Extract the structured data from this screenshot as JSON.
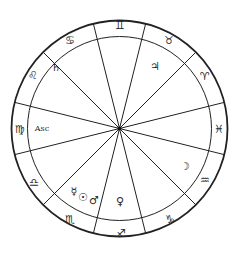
{
  "chart_data": {
    "type": "diagram",
    "title": "",
    "kind": "astrological-natal-chart",
    "geometry": {
      "center": [
        119.5,
        128.5
      ],
      "outer_radius": 108,
      "inner_radius": 92,
      "line_color": "#222222"
    },
    "house_cusp_angles_deg": [
      14,
      45,
      76,
      104,
      135,
      166,
      194,
      225,
      256,
      284,
      315,
      346
    ],
    "signs": [
      {
        "name": "Gemini",
        "glyph": "♊",
        "x": 120,
        "y": 25
      },
      {
        "name": "Cancer",
        "glyph": "♋",
        "x": 70,
        "y": 40
      },
      {
        "name": "Leo",
        "glyph": "♌",
        "x": 33,
        "y": 75
      },
      {
        "name": "Virgo",
        "glyph": "♍",
        "x": 20,
        "y": 129
      },
      {
        "name": "Libra",
        "glyph": "♎",
        "x": 34,
        "y": 182
      },
      {
        "name": "Scorpio",
        "glyph": "♏",
        "x": 70,
        "y": 219
      },
      {
        "name": "Sagittarius",
        "glyph": "♐",
        "x": 121,
        "y": 233
      },
      {
        "name": "Capricorn",
        "glyph": "♑",
        "x": 170,
        "y": 219
      },
      {
        "name": "Aquarius",
        "glyph": "♒",
        "x": 205,
        "y": 180
      },
      {
        "name": "Pisces",
        "glyph": "♓",
        "x": 219,
        "y": 129
      },
      {
        "name": "Aries",
        "glyph": "♈",
        "x": 205,
        "y": 76
      },
      {
        "name": "Taurus",
        "glyph": "♉",
        "x": 169,
        "y": 40
      }
    ],
    "bodies": [
      {
        "name": "Saturn",
        "glyph": "♄",
        "x": 56,
        "y": 67
      },
      {
        "name": "Jupiter",
        "glyph": "♃",
        "x": 155,
        "y": 66
      },
      {
        "name": "Ascendant",
        "glyph": "Asc",
        "x": 42,
        "y": 128
      },
      {
        "name": "Moon",
        "glyph": "☽",
        "x": 185,
        "y": 166
      },
      {
        "name": "Mercury",
        "glyph": "☿",
        "x": 74,
        "y": 191
      },
      {
        "name": "Sun",
        "glyph": "☉",
        "x": 83,
        "y": 197
      },
      {
        "name": "Mars",
        "glyph": "♂",
        "x": 94,
        "y": 200
      },
      {
        "name": "Venus",
        "glyph": "♀",
        "x": 120,
        "y": 201
      }
    ]
  }
}
